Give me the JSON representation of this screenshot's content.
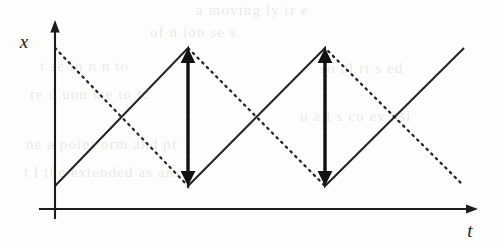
{
  "figure": {
    "axes": {
      "y_label": "x",
      "x_label": "t",
      "origin_x": 55,
      "origin_y": 209,
      "x_axis_start": 40,
      "x_axis_end": 478,
      "y_axis_top": 20,
      "y_axis_bottom": 218
    },
    "bleed_text": [
      {
        "text": "a  moving   ly  tr  e",
        "x": 196,
        "y": 2
      },
      {
        "text": "of  n  ion  se  s",
        "x": 150,
        "y": 24
      },
      {
        "text": "t   se  in   n   n  to",
        "x": 40,
        "y": 58
      },
      {
        "text": "re  d  uon  me  to  tc",
        "x": 30,
        "y": 86
      },
      {
        "text": "ne  a  point  orm  and  pr",
        "x": 26,
        "y": 136
      },
      {
        "text": "t  l  the  extended  as  an",
        "x": 24,
        "y": 164
      },
      {
        "text": "u  alt  s  co  ev  nsi",
        "x": 300,
        "y": 108
      },
      {
        "text": "so  ul  rt  s  ed",
        "x": 320,
        "y": 60
      }
    ]
  },
  "chart_data": {
    "type": "line",
    "title": "",
    "xlabel": "t",
    "ylabel": "x",
    "grid": false,
    "legend": null,
    "xlim": [
      0,
      1
    ],
    "ylim": [
      0,
      1
    ],
    "series": [
      {
        "name": "rising-sawtooth-solid",
        "style": "solid",
        "points": [
          {
            "x": 55,
            "y": 186
          },
          {
            "x": 188,
            "y": 48
          },
          {
            "x": 188,
            "y": 186
          },
          {
            "x": 325,
            "y": 48
          },
          {
            "x": 325,
            "y": 186
          },
          {
            "x": 464,
            "y": 48
          }
        ]
      },
      {
        "name": "falling-sawtooth-dotted",
        "style": "dotted",
        "points": [
          {
            "x": 55,
            "y": 48
          },
          {
            "x": 188,
            "y": 186
          },
          {
            "x": 188,
            "y": 48
          },
          {
            "x": 325,
            "y": 186
          },
          {
            "x": 325,
            "y": 48
          },
          {
            "x": 464,
            "y": 186
          }
        ]
      }
    ],
    "annotations": [
      {
        "name": "jump-arrow-1",
        "type": "double-headed-vertical-arrow",
        "x": 188,
        "y_top": 48,
        "y_bottom": 186
      },
      {
        "name": "jump-arrow-2",
        "type": "double-headed-vertical-arrow",
        "x": 325,
        "y_top": 48,
        "y_bottom": 186
      }
    ]
  }
}
